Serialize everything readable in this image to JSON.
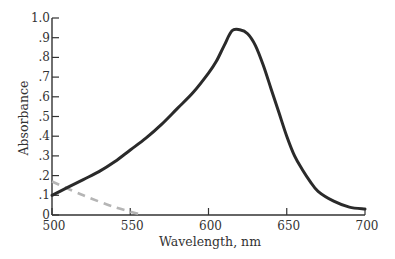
{
  "chart_data": {
    "type": "line",
    "title": "",
    "xlabel": "Wavelength, nm",
    "ylabel": "Absorbance",
    "xlim": [
      500,
      700
    ],
    "ylim": [
      0,
      1.0
    ],
    "grid": false,
    "legend": null,
    "x_ticks": [
      500,
      550,
      600,
      650,
      700
    ],
    "x_tick_labels": [
      "500",
      "550",
      "600",
      "650",
      "700"
    ],
    "y_ticks": [
      0,
      0.1,
      0.2,
      0.3,
      0.4,
      0.5,
      0.6,
      0.7,
      0.8,
      0.9,
      1.0
    ],
    "y_tick_labels": [
      "0",
      ".1",
      ".2",
      ".3",
      ".4",
      ".5",
      ".6",
      ".7",
      ".8",
      ".9",
      "1.0"
    ],
    "series": [
      {
        "name": "absorbance-spectrum",
        "style": "solid",
        "color": "#2a2a2a",
        "x": [
          500,
          510,
          520,
          530,
          540,
          550,
          560,
          570,
          580,
          590,
          600,
          605,
          610,
          615,
          620,
          625,
          630,
          635,
          640,
          645,
          650,
          655,
          660,
          665,
          670,
          680,
          690,
          700
        ],
        "values": [
          0.1,
          0.14,
          0.18,
          0.22,
          0.27,
          0.33,
          0.39,
          0.46,
          0.54,
          0.62,
          0.72,
          0.78,
          0.86,
          0.935,
          0.94,
          0.92,
          0.86,
          0.76,
          0.64,
          0.52,
          0.4,
          0.3,
          0.23,
          0.17,
          0.12,
          0.07,
          0.04,
          0.03
        ]
      },
      {
        "name": "baseline-dashed",
        "style": "dashed",
        "color": "#b5b5b5",
        "x": [
          500,
          520,
          540,
          558
        ],
        "values": [
          0.17,
          0.1,
          0.04,
          0.0
        ]
      }
    ]
  }
}
